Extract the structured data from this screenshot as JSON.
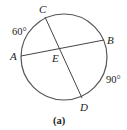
{
  "diagram": {
    "circle": {
      "cx": 64,
      "cy": 57,
      "r": 43,
      "stroke": "#555555"
    },
    "points": {
      "A": {
        "label": "A",
        "x": 21,
        "y": 56
      },
      "B": {
        "label": "B",
        "x": 104,
        "y": 40
      },
      "C": {
        "label": "C",
        "x": 45,
        "y": 17
      },
      "D": {
        "label": "D",
        "x": 82,
        "y": 98
      },
      "E": {
        "label": "E",
        "x": 58,
        "y": 50
      }
    },
    "chords": [
      {
        "from": "A",
        "to": "B"
      },
      {
        "from": "C",
        "to": "D"
      }
    ],
    "arcs": {
      "AC": {
        "label": "60°"
      },
      "BD": {
        "label": "90°"
      }
    },
    "caption": "(a)"
  }
}
